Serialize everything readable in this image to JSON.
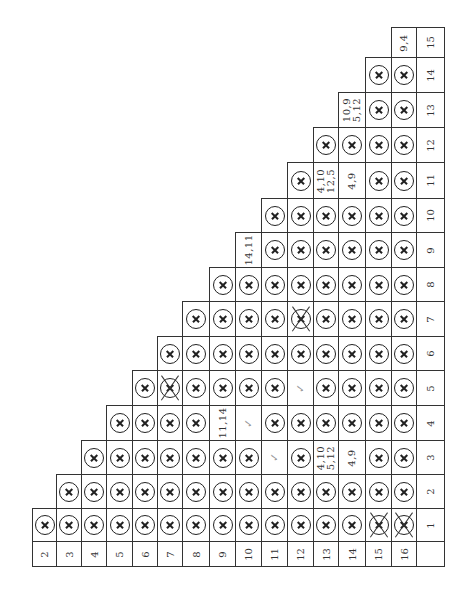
{
  "chart_data": {
    "type": "table",
    "title": "",
    "row_labels": [
      "2",
      "3",
      "4",
      "5",
      "6",
      "7",
      "8",
      "9",
      "10",
      "11",
      "12",
      "13",
      "14",
      "15",
      "16"
    ],
    "column_labels": [
      "1",
      "2",
      "3",
      "4",
      "5",
      "6",
      "7",
      "8",
      "9",
      "10",
      "11",
      "12",
      "13",
      "14",
      "15"
    ],
    "cells": {
      "1": {
        "2": "X",
        "3": "X",
        "4": "X",
        "5": "X",
        "6": "X",
        "7": "X",
        "8": "X",
        "9": "X",
        "10": "X",
        "11": "X",
        "12": "X",
        "13": "X",
        "14": "X",
        "15": "XX",
        "16": "XX"
      },
      "2": {
        "3": "X",
        "4": "X",
        "5": "X",
        "6": "X",
        "7": "X",
        "8": "X",
        "9": "X",
        "10": "X",
        "11": "X",
        "12": "X",
        "13": "X",
        "14": "X",
        "15": "X",
        "16": "X"
      },
      "3": {
        "4": "X",
        "5": "X",
        "6": "X",
        "7": "X",
        "8": "X",
        "9": "X",
        "10": "X",
        "11": "✓",
        "12": "X",
        "13": "4,10\n5,12",
        "14": "4,9",
        "15": "X",
        "16": "X"
      },
      "4": {
        "5": "X",
        "6": "X",
        "7": "X",
        "8": "X",
        "9": "11,14",
        "10": "✓",
        "11": "X",
        "12": "X",
        "13": "X",
        "14": "X",
        "15": "X",
        "16": "X"
      },
      "5": {
        "6": "X",
        "7": "XX",
        "8": "X",
        "9": "X",
        "10": "X",
        "11": "X",
        "12": "✓",
        "13": "X",
        "14": "X",
        "15": "X",
        "16": "X"
      },
      "6": {
        "7": "X",
        "8": "X",
        "9": "X",
        "10": "X",
        "11": "X",
        "12": "X",
        "13": "X",
        "14": "X",
        "15": "X",
        "16": "X"
      },
      "7": {
        "8": "X",
        "9": "X",
        "10": "X",
        "11": "X",
        "12": "XX",
        "13": "X",
        "14": "X",
        "15": "X",
        "16": "X"
      },
      "8": {
        "9": "X",
        "10": "X",
        "11": "X",
        "12": "X",
        "13": "X",
        "14": "X",
        "15": "X",
        "16": "X"
      },
      "9": {
        "10": "14,11",
        "11": "X",
        "12": "X",
        "13": "X",
        "14": "X",
        "15": "X",
        "16": "X"
      },
      "10": {
        "11": "X",
        "12": "X",
        "13": "X",
        "14": "X",
        "15": "X",
        "16": "X"
      },
      "11": {
        "12": "X",
        "13": "4,10\n12,5",
        "14": "4,9",
        "15": "X",
        "16": "X"
      },
      "12": {
        "13": "X",
        "14": "X",
        "15": "X",
        "16": "X"
      },
      "13": {
        "14": "10,9\n5,12",
        "15": "X",
        "16": "X"
      },
      "14": {
        "15": "X",
        "16": "X"
      },
      "15": {
        "16": "9,4"
      }
    },
    "legend": {
      "X": "circled-x (incompatible)",
      "XX": "crossed-out circled-x",
      "✓": "check (compatible)"
    }
  },
  "layout": {
    "col_edges": [
      32,
      56,
      81,
      106,
      132,
      157,
      182,
      209,
      235,
      261,
      287,
      313,
      338,
      365,
      391,
      416,
      444
    ],
    "row_edges": [
      27,
      57,
      92,
      127,
      162,
      198,
      232,
      267,
      301,
      336,
      370,
      405,
      440,
      474,
      508,
      541,
      566
    ]
  }
}
